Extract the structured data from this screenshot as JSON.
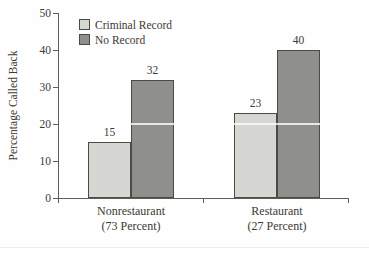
{
  "chart_data": {
    "type": "bar",
    "title": "",
    "xlabel": "",
    "ylabel": "Percentage Called Back",
    "ylim": [
      0,
      50
    ],
    "yticks": [
      0,
      10,
      20,
      30,
      40,
      50
    ],
    "grid": "off",
    "legend_position": "top-left",
    "overlay_gridline_at": 20,
    "categories": [
      {
        "label": "Nonrestaurant",
        "sublabel": "(73 Percent)"
      },
      {
        "label": "Restaurant",
        "sublabel": "(27 Percent)"
      }
    ],
    "series": [
      {
        "name": "Criminal Record",
        "color": "#d6d7d2",
        "values": [
          15,
          23
        ]
      },
      {
        "name": "No Record",
        "color": "#8f908e",
        "values": [
          32,
          40
        ]
      }
    ]
  },
  "colors": {
    "axis": "#5f5e57",
    "text": "#3c3a33",
    "bar_border": "#4b4a43"
  }
}
